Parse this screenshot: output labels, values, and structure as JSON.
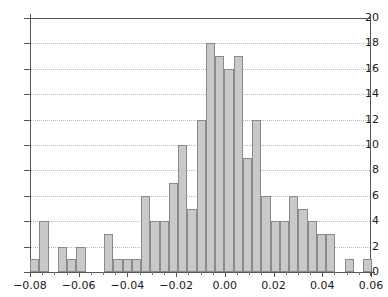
{
  "chart_data": {
    "type": "bar",
    "title": "",
    "xlabel": "",
    "ylabel": "",
    "xlim": [
      -0.08,
      0.06
    ],
    "ylim": [
      0,
      20
    ],
    "bin_width": 0.005,
    "grid": true,
    "legend": null,
    "bar_fill": "#c9c9c9",
    "bar_edge": "#8a8a8a",
    "xticks": [
      "-0.08",
      "-0.06",
      "-0.04",
      "-0.02",
      "0.00",
      "0.02",
      "0.04",
      "0.06"
    ],
    "xtick_values": [
      -0.08,
      -0.06,
      -0.04,
      -0.02,
      0.0,
      0.02,
      0.04,
      0.06
    ],
    "yticks": [
      "0",
      "2",
      "4",
      "6",
      "8",
      "10",
      "12",
      "14",
      "16",
      "18",
      "20"
    ],
    "ytick_values": [
      0,
      2,
      4,
      6,
      8,
      10,
      12,
      14,
      16,
      18,
      20
    ],
    "bin_edges": [
      -0.08,
      -0.075,
      -0.07,
      -0.065,
      -0.06,
      -0.055,
      -0.05,
      -0.045,
      -0.04,
      -0.035,
      -0.03,
      -0.025,
      -0.02,
      -0.015,
      -0.01,
      -0.005,
      0.0,
      0.005,
      0.01,
      0.015,
      0.02,
      0.025,
      0.03,
      0.035,
      0.04,
      0.045,
      0.05,
      0.055,
      0.06
    ],
    "categories": [
      "-0.0800",
      "-0.0755",
      "-0.0710",
      "-0.0665",
      "-0.0620",
      "-0.0575",
      "-0.0530",
      "-0.0485",
      "-0.0440",
      "-0.0395",
      "-0.0350",
      "-0.0305",
      "-0.0260",
      "-0.0215",
      "-0.0170",
      "-0.0125",
      "-0.0080",
      "-0.0035",
      "0.0010",
      "0.0055",
      "0.0100",
      "0.0145",
      "0.0190",
      "0.0235",
      "0.0280",
      "0.0325",
      "0.0370",
      "0.0415",
      "0.0460",
      "0.0505",
      "0.0550",
      "0.0595",
      "0.0640",
      "0.0685",
      "0.0730",
      "0.0775",
      "0.0820"
    ],
    "values": [
      1,
      4,
      0,
      2,
      1,
      2,
      0,
      0,
      3,
      1,
      1,
      1,
      6,
      4,
      4,
      7,
      10,
      5,
      12,
      18,
      17,
      16,
      17,
      9,
      12,
      6,
      4,
      4,
      6,
      5,
      4,
      3,
      3,
      0,
      1,
      0,
      1
    ],
    "bars": [
      {
        "x0": -0.08,
        "x1": -0.0762,
        "count": 1
      },
      {
        "x0": -0.0762,
        "x1": -0.0724,
        "count": 4
      },
      {
        "x0": -0.0724,
        "x1": -0.0686,
        "count": 0
      },
      {
        "x0": -0.0686,
        "x1": -0.0648,
        "count": 2
      },
      {
        "x0": -0.0648,
        "x1": -0.061,
        "count": 1
      },
      {
        "x0": -0.061,
        "x1": -0.0572,
        "count": 2
      },
      {
        "x0": -0.0572,
        "x1": -0.0534,
        "count": 0
      },
      {
        "x0": -0.0534,
        "x1": -0.0496,
        "count": 0
      },
      {
        "x0": -0.0496,
        "x1": -0.0458,
        "count": 3
      },
      {
        "x0": -0.0458,
        "x1": -0.042,
        "count": 1
      },
      {
        "x0": -0.042,
        "x1": -0.0382,
        "count": 1
      },
      {
        "x0": -0.0382,
        "x1": -0.0344,
        "count": 1
      },
      {
        "x0": -0.0344,
        "x1": -0.0306,
        "count": 6
      },
      {
        "x0": -0.0306,
        "x1": -0.0268,
        "count": 4
      },
      {
        "x0": -0.0268,
        "x1": -0.023,
        "count": 4
      },
      {
        "x0": -0.023,
        "x1": -0.0192,
        "count": 7
      },
      {
        "x0": -0.0192,
        "x1": -0.0154,
        "count": 10
      },
      {
        "x0": -0.0154,
        "x1": -0.0116,
        "count": 5
      },
      {
        "x0": -0.0116,
        "x1": -0.0078,
        "count": 12
      },
      {
        "x0": -0.0078,
        "x1": -0.004,
        "count": 18
      },
      {
        "x0": -0.004,
        "x1": -0.0002,
        "count": 17
      },
      {
        "x0": -0.0002,
        "x1": 0.0036,
        "count": 16
      },
      {
        "x0": 0.0036,
        "x1": 0.0074,
        "count": 17
      },
      {
        "x0": 0.0074,
        "x1": 0.0112,
        "count": 9
      },
      {
        "x0": 0.0112,
        "x1": 0.015,
        "count": 12
      },
      {
        "x0": 0.015,
        "x1": 0.0188,
        "count": 6
      },
      {
        "x0": 0.0188,
        "x1": 0.0226,
        "count": 4
      },
      {
        "x0": 0.0226,
        "x1": 0.0264,
        "count": 4
      },
      {
        "x0": 0.0264,
        "x1": 0.0302,
        "count": 6
      },
      {
        "x0": 0.0302,
        "x1": 0.034,
        "count": 5
      },
      {
        "x0": 0.034,
        "x1": 0.0378,
        "count": 4
      },
      {
        "x0": 0.0378,
        "x1": 0.0416,
        "count": 3
      },
      {
        "x0": 0.0416,
        "x1": 0.0454,
        "count": 3
      },
      {
        "x0": 0.0454,
        "x1": 0.0492,
        "count": 0
      },
      {
        "x0": 0.0492,
        "x1": 0.053,
        "count": 1
      },
      {
        "x0": 0.053,
        "x1": 0.0568,
        "count": 0
      },
      {
        "x0": 0.0568,
        "x1": 0.0606,
        "count": 1
      }
    ]
  }
}
